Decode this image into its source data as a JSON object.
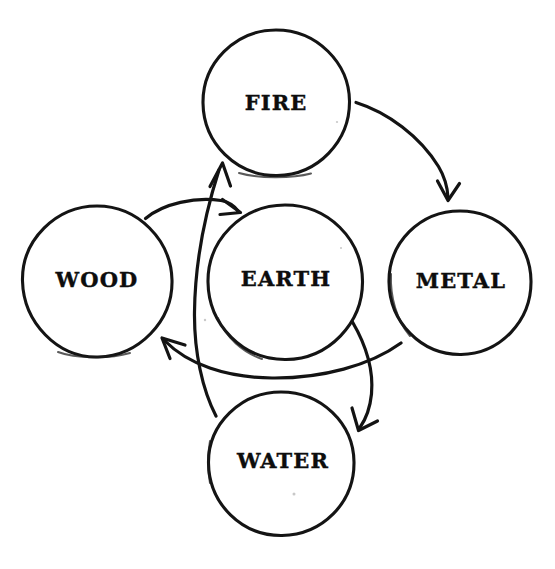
{
  "document": {
    "title": "Five Elements Generating Cycle",
    "background_color": "#ffffff",
    "ink_color": "#131313",
    "style": "hand-drawn pen sketch",
    "width": 555,
    "height": 569
  },
  "diagram": {
    "type": "cycle-diagram",
    "node_shape": "circle",
    "nodes": [
      {
        "id": "fire",
        "label": "FIRE",
        "cx": 276,
        "cy": 103,
        "r": 73
      },
      {
        "id": "wood",
        "label": "WOOD",
        "cx": 97,
        "cy": 281,
        "r": 75
      },
      {
        "id": "earth",
        "label": "EARTH",
        "cx": 285,
        "cy": 282,
        "r": 77
      },
      {
        "id": "metal",
        "label": "METAL",
        "cx": 460,
        "cy": 282,
        "r": 71
      },
      {
        "id": "water",
        "label": "WATER",
        "cx": 281,
        "cy": 463,
        "r": 72
      }
    ],
    "edges": [
      {
        "id": "fire-to-metal",
        "from": "FIRE",
        "to": "METAL",
        "direction": "clockwise-arc"
      },
      {
        "id": "earth-to-water",
        "from": "EARTH",
        "to": "WATER",
        "direction": "downward-arc"
      },
      {
        "id": "metal-to-wood",
        "from": "METAL",
        "to": "WOOD",
        "direction": "leftward-arc"
      },
      {
        "id": "wood-to-earth",
        "from": "WOOD",
        "to": "EARTH",
        "direction": "rightward-arc"
      },
      {
        "id": "water-to-fire",
        "from": "WATER",
        "to": "FIRE",
        "direction": "upward-arc"
      }
    ]
  },
  "labels": {
    "fire": "FIRE",
    "wood": "WOOD",
    "earth": "EARTH",
    "metal": "METAL",
    "water": "WATER"
  }
}
